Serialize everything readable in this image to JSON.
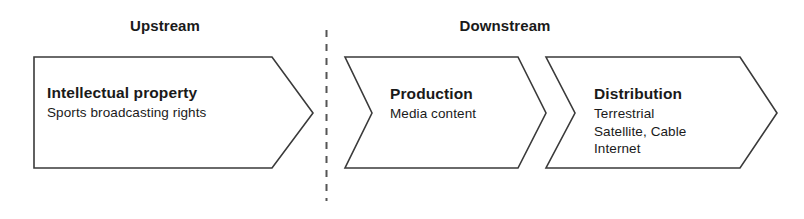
{
  "diagram": {
    "type": "value-chain",
    "sections": [
      {
        "id": "upstream",
        "label": "Upstream"
      },
      {
        "id": "downstream",
        "label": "Downstream"
      }
    ],
    "divider": {
      "name": "upstream-downstream-divider",
      "style": "dashed-vertical",
      "color": "#555555"
    },
    "stages": [
      {
        "id": "intellectual-property",
        "section": "upstream",
        "shape": "arrow-right",
        "title": "Intellectual property",
        "lines": [
          "Sports broadcasting rights"
        ],
        "stroke": "#3a3a3a",
        "fill": "#ffffff"
      },
      {
        "id": "production",
        "section": "downstream",
        "shape": "chevron-right",
        "title": "Production",
        "lines": [
          "Media content"
        ],
        "stroke": "#3a3a3a",
        "fill": "#ffffff"
      },
      {
        "id": "distribution",
        "section": "downstream",
        "shape": "chevron-right",
        "title": "Distribution",
        "lines": [
          "Terrestrial",
          "Satellite, Cable",
          "Internet"
        ],
        "stroke": "#3a3a3a",
        "fill": "#ffffff"
      }
    ]
  }
}
